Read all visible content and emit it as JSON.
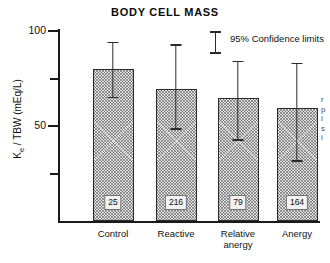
{
  "figure": {
    "title": "BODY CELL MASS"
  },
  "legend": {
    "label": "95% Confidence limits",
    "marker": "error-bar-marker"
  },
  "edge_fragments": [
    "r",
    "p",
    "i",
    "s",
    "i"
  ],
  "chart_data": {
    "type": "bar",
    "title": "BODY CELL MASS",
    "xlabel": "",
    "ylabel": "Kₑ / TBW (mEq/L)",
    "ylabel_parts": {
      "pre": "K",
      "sub": "e",
      "post": " / TBW (mEq/L)"
    },
    "categories": [
      "Control",
      "Reactive",
      "Relative\nanergy",
      "Anergy"
    ],
    "values": [
      80.0,
      69.5,
      64.5,
      59.5
    ],
    "n_labels": [
      "25",
      "216",
      "79",
      "164"
    ],
    "error_low": [
      65.0,
      48.5,
      42.5,
      31.5
    ],
    "error_high": [
      94.0,
      92.5,
      84.0,
      83.0
    ],
    "ylim": [
      0,
      100
    ],
    "yticks": [
      100,
      75,
      50,
      25
    ],
    "ytick_labels": [
      "100",
      "",
      "50",
      ""
    ],
    "grid": false,
    "legend_position": "top-right",
    "legend_entries": [
      "95% Confidence limits"
    ]
  }
}
